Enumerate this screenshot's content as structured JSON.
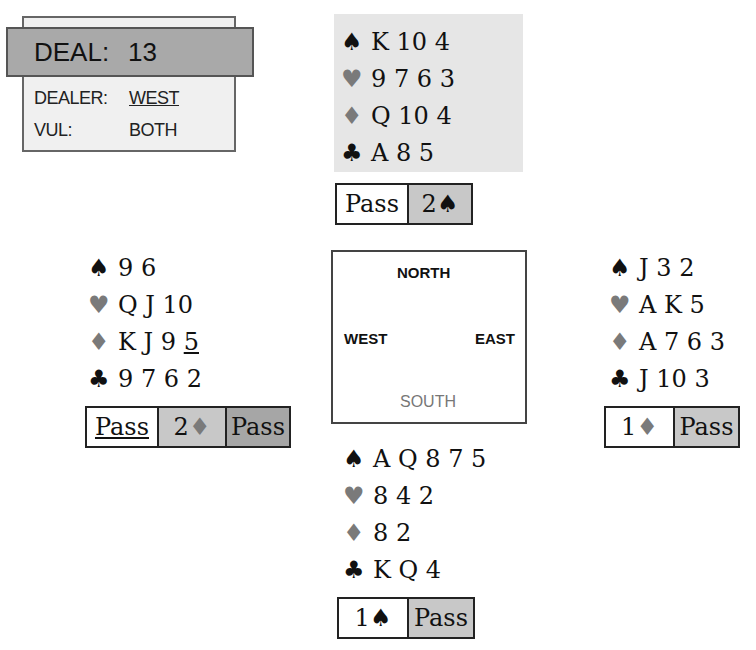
{
  "deal": {
    "title_label": "DEAL:",
    "number": "13",
    "dealer_label": "DEALER:",
    "dealer": "WEST",
    "vul_label": "VUL:",
    "vul": "BOTH"
  },
  "compass": {
    "north": "NORTH",
    "west": "WEST",
    "east": "EAST",
    "south": "SOUTH"
  },
  "suit_glyphs": {
    "spades": "♠",
    "hearts": "♥",
    "diamonds": "♦",
    "clubs": "♣"
  },
  "hands": {
    "north": {
      "spades": "K 10 4",
      "hearts": "9 7 6 3",
      "diamonds": "Q 10 4",
      "clubs": "A 8 5"
    },
    "west": {
      "spades": "9 6",
      "hearts": "Q J 10",
      "diamonds_main": "K J 9 ",
      "diamonds_underlined": "5",
      "clubs": "9 7 6 2"
    },
    "east": {
      "spades": "J 3 2",
      "hearts": "A K 5",
      "diamonds": "A 7 6 3",
      "clubs": "J 10 3"
    },
    "south": {
      "spades": "A Q 8 7 5",
      "hearts": "8 4 2",
      "diamonds": "8 2",
      "clubs": "K Q 4"
    }
  },
  "bidding": {
    "north": [
      {
        "text": "Pass"
      },
      {
        "level": "2",
        "suit": "♠"
      }
    ],
    "west": [
      {
        "text": "Pass",
        "underlined": true
      },
      {
        "level": "2",
        "suit": "♦"
      },
      {
        "text": "Pass"
      }
    ],
    "east": [
      {
        "level": "1",
        "suit": "♦"
      },
      {
        "text": "Pass"
      }
    ],
    "south": [
      {
        "level": "1",
        "suit": "♠"
      },
      {
        "text": "Pass"
      }
    ]
  },
  "colors": {
    "header_gray": "#a9a9a9",
    "north_bg": "#e6e6e6",
    "red_suit": "#7a7a7a",
    "bid_light": "#c8c8c8",
    "bid_dark": "#a6a6a6"
  }
}
